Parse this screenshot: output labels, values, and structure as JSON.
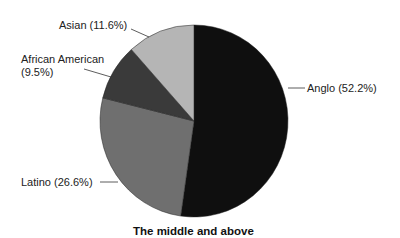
{
  "chart_data": {
    "type": "pie",
    "title": "The middle and above",
    "categories": [
      "Anglo",
      "Latino",
      "African American",
      "Asian"
    ],
    "values": [
      52.2,
      26.6,
      9.5,
      11.6
    ],
    "unit": "%",
    "colors": [
      "#0f0f0f",
      "#6f6f6f",
      "#3a3a3a",
      "#b5b5b5"
    ],
    "start_angle": "12 o'clock",
    "direction": "clockwise",
    "legend": "none (leader-line labels)",
    "labels": [
      {
        "line1": "Anglo (52.2%)",
        "line2": ""
      },
      {
        "line1": "Latino (26.6%)",
        "line2": ""
      },
      {
        "line1": "African American",
        "line2": "(9.5%)"
      },
      {
        "line1": "Asian (11.6%)",
        "line2": ""
      }
    ]
  }
}
